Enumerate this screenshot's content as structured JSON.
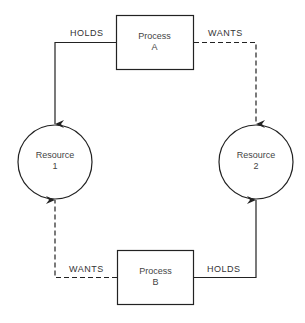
{
  "diagram": {
    "processes": [
      {
        "id": "A",
        "line1": "Process",
        "line2": "A"
      },
      {
        "id": "B",
        "line1": "Process",
        "line2": "B"
      }
    ],
    "resources": [
      {
        "id": "1",
        "line1": "Resource",
        "line2": "1"
      },
      {
        "id": "2",
        "line1": "Resource",
        "line2": "2"
      }
    ],
    "edges": [
      {
        "from": "Process A",
        "to": "Resource 1",
        "label": "HOLDS",
        "style": "solid"
      },
      {
        "from": "Process A",
        "to": "Resource 2",
        "label": "WANTS",
        "style": "dashed"
      },
      {
        "from": "Process B",
        "to": "Resource 1",
        "label": "WANTS",
        "style": "dashed"
      },
      {
        "from": "Process B",
        "to": "Resource 2",
        "label": "HOLDS",
        "style": "solid"
      }
    ]
  }
}
